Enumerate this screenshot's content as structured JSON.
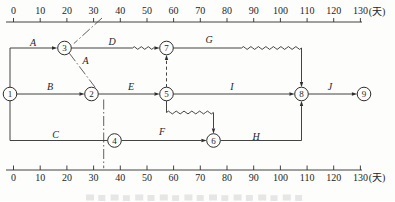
{
  "axis": {
    "ticks": [
      "0",
      "10",
      "20",
      "30",
      "40",
      "50",
      "60",
      "70",
      "80",
      "90",
      "100",
      "110",
      "120",
      "130"
    ],
    "unit": "(天)"
  },
  "diagram": {
    "type": "time-scaled-network-plan",
    "nodes": [
      "1",
      "2",
      "3",
      "4",
      "5",
      "6",
      "7",
      "8",
      "9"
    ],
    "activities": [
      {
        "label": "A",
        "from": "1",
        "to": "3"
      },
      {
        "label": "B",
        "from": "1",
        "to": "2"
      },
      {
        "label": "C",
        "from": "1",
        "to": "4"
      },
      {
        "label": "D",
        "from": "3",
        "to": "7"
      },
      {
        "label": "E",
        "from": "2",
        "to": "5"
      },
      {
        "label": "F",
        "from": "4",
        "to": "6"
      },
      {
        "label": "G",
        "from": "7",
        "to": "8"
      },
      {
        "label": "H",
        "from": "6",
        "to": "8"
      },
      {
        "label": "I",
        "from": "5",
        "to": "8"
      },
      {
        "label": "J",
        "from": "8",
        "to": "9"
      }
    ],
    "dummy_links": [
      {
        "from": "5",
        "to": "7",
        "style": "dashed-vertical"
      },
      {
        "from": "5",
        "to": "6",
        "style": "wavy-float"
      }
    ],
    "annotation": {
      "label": "A",
      "style": "dash-dot progress line through nodes 3 and 2 down to bottom axis"
    }
  }
}
